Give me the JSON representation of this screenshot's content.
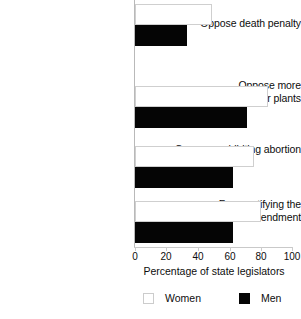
{
  "chart_data": {
    "type": "bar",
    "orientation": "horizontal",
    "title": "",
    "subtitle": "",
    "xlabel": "Percentage of state legislators",
    "ylabel": "",
    "xlim": [
      0,
      100
    ],
    "xticks": [
      0,
      20,
      40,
      60,
      80,
      100
    ],
    "xtick_labels": [
      "0",
      "20",
      "40",
      "60",
      "80",
      "100"
    ],
    "grid": false,
    "legend_position": "bottom",
    "categories": [
      "Oppose death penalty",
      "Oppose more\nnuclear power plants",
      "Oppose prohibiting abortion",
      "Favor ratifying the\nEqual Rights Amendment"
    ],
    "series": [
      {
        "name": "Women",
        "color": "#ffffff",
        "edge_color": "#cfcfcf",
        "values": [
          49,
          84,
          75,
          80
        ]
      },
      {
        "name": "Men",
        "color": "#000000",
        "edge_color": "#000000",
        "values": [
          33,
          71,
          62,
          62
        ]
      }
    ],
    "legend": [
      {
        "label": "Women",
        "swatch": "white-square"
      },
      {
        "label": "Men",
        "swatch": "black-square"
      }
    ]
  }
}
